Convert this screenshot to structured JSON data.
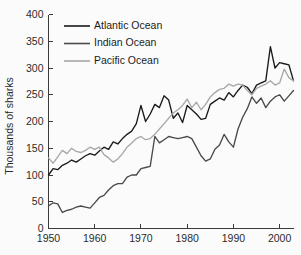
{
  "chart_data": {
    "type": "line",
    "title": "",
    "xlabel": "",
    "ylabel": "Thousands of sharks",
    "xlim": [
      1950,
      2003
    ],
    "ylim": [
      0,
      400
    ],
    "xticks": [
      1950,
      1960,
      1970,
      1980,
      1990,
      2000
    ],
    "yticks": [
      0,
      50,
      100,
      150,
      200,
      250,
      300,
      350,
      400
    ],
    "xtick_labels": [
      "1950",
      "1960",
      "1970",
      "1980",
      "1990",
      "2000"
    ],
    "ytick_labels": [
      "0",
      "50",
      "100",
      "150",
      "200",
      "250",
      "300",
      "350",
      "400"
    ],
    "grid": false,
    "legend_position": "upper-left-inside",
    "x": [
      1950,
      1951,
      1952,
      1953,
      1954,
      1955,
      1956,
      1957,
      1958,
      1959,
      1960,
      1961,
      1962,
      1963,
      1964,
      1965,
      1966,
      1967,
      1968,
      1969,
      1970,
      1971,
      1972,
      1973,
      1974,
      1975,
      1976,
      1977,
      1978,
      1979,
      1980,
      1981,
      1982,
      1983,
      1984,
      1985,
      1986,
      1987,
      1988,
      1989,
      1990,
      1991,
      1992,
      1993,
      1994,
      1995,
      1996,
      1997,
      1998,
      1999,
      2000,
      2001,
      2002,
      2003
    ],
    "series": [
      {
        "name": "Atlantic Ocean",
        "color": "#1a1a1a",
        "values": [
          100,
          112,
          110,
          118,
          122,
          128,
          124,
          130,
          136,
          140,
          137,
          145,
          152,
          148,
          162,
          158,
          168,
          176,
          182,
          196,
          230,
          200,
          214,
          232,
          226,
          248,
          240,
          206,
          216,
          198,
          230,
          222,
          214,
          204,
          206,
          232,
          238,
          244,
          240,
          254,
          246,
          258,
          268,
          264,
          252,
          268,
          272,
          276,
          340,
          300,
          310,
          308,
          306,
          276
        ]
      },
      {
        "name": "Indian Ocean",
        "color": "#4a4a4a",
        "values": [
          42,
          48,
          46,
          30,
          34,
          36,
          40,
          42,
          40,
          38,
          48,
          58,
          62,
          72,
          80,
          84,
          84,
          96,
          100,
          100,
          112,
          114,
          116,
          172,
          160,
          166,
          172,
          170,
          168,
          170,
          172,
          168,
          152,
          136,
          126,
          130,
          148,
          156,
          176,
          162,
          152,
          186,
          208,
          224,
          246,
          234,
          244,
          226,
          238,
          246,
          250,
          238,
          248,
          258
        ]
      },
      {
        "name": "Pacific Ocean",
        "color": "#a8a8a8",
        "values": [
          132,
          122,
          134,
          146,
          140,
          150,
          144,
          142,
          146,
          152,
          148,
          152,
          138,
          132,
          124,
          130,
          140,
          152,
          160,
          168,
          172,
          166,
          168,
          176,
          186,
          196,
          206,
          216,
          222,
          230,
          242,
          226,
          236,
          222,
          232,
          246,
          254,
          260,
          262,
          270,
          266,
          270,
          268,
          258,
          250,
          262,
          266,
          270,
          276,
          268,
          272,
          298,
          282,
          276
        ]
      }
    ]
  }
}
